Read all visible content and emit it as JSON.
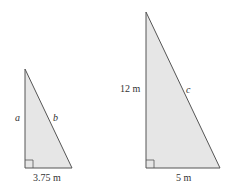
{
  "diagram": {
    "fill_color": "#e6e6e6",
    "stroke_color": "#555555",
    "small_triangle": {
      "vertical_side_label": "a",
      "hypotenuse_label": "b",
      "base_label": "3.75 m",
      "right_angle_marker": true
    },
    "large_triangle": {
      "vertical_side_label": "12 m",
      "hypotenuse_label": "c",
      "base_label": "5 m",
      "right_angle_marker": true
    }
  }
}
